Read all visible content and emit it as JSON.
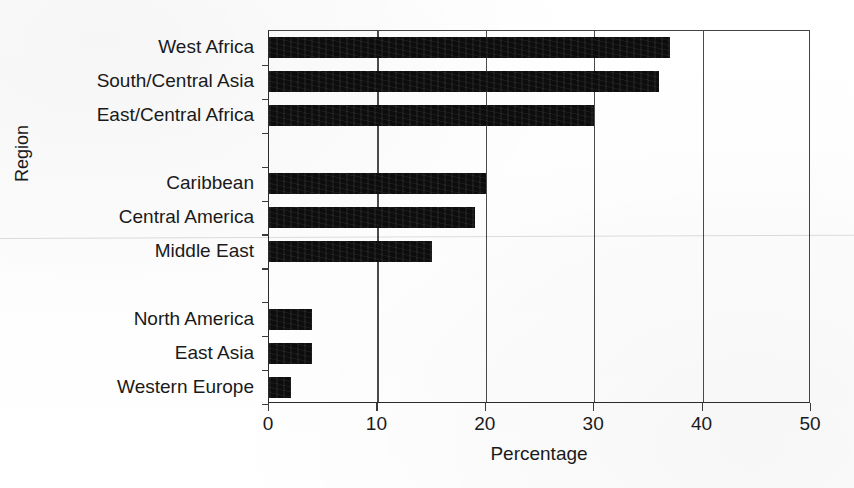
{
  "chart_data": {
    "type": "bar",
    "orientation": "horizontal",
    "title": "",
    "xlabel": "Percentage",
    "ylabel": "Region",
    "xlim": [
      0,
      50
    ],
    "xticks": [
      0,
      10,
      20,
      30,
      40,
      50
    ],
    "grid": "vertical",
    "legend": "none",
    "bar_color": "#0d0d0d",
    "categories": [
      "West Africa",
      "South/Central Asia",
      "East/Central Africa",
      "Caribbean",
      "Central America",
      "Middle East",
      "North America",
      "East Asia",
      "Western Europe"
    ],
    "values": [
      37,
      36,
      30,
      20,
      19,
      15,
      4,
      4,
      2
    ],
    "groups": [
      {
        "name": "high",
        "categories": [
          "West Africa",
          "South/Central Asia",
          "East/Central Africa"
        ]
      },
      {
        "name": "medium",
        "categories": [
          "Caribbean",
          "Central America",
          "Middle East"
        ]
      },
      {
        "name": "low",
        "categories": [
          "North America",
          "East Asia",
          "Western Europe"
        ]
      }
    ],
    "slots": [
      {
        "kind": "bar",
        "category": "West Africa",
        "value": 37
      },
      {
        "kind": "bar",
        "category": "South/Central Asia",
        "value": 36
      },
      {
        "kind": "bar",
        "category": "East/Central Africa",
        "value": 30
      },
      {
        "kind": "gap",
        "category": "",
        "value": null
      },
      {
        "kind": "bar",
        "category": "Caribbean",
        "value": 20
      },
      {
        "kind": "bar",
        "category": "Central America",
        "value": 19
      },
      {
        "kind": "bar",
        "category": "Middle East",
        "value": 15
      },
      {
        "kind": "gap",
        "category": "",
        "value": null
      },
      {
        "kind": "bar",
        "category": "North America",
        "value": 4
      },
      {
        "kind": "bar",
        "category": "East Asia",
        "value": 4
      },
      {
        "kind": "bar",
        "category": "Western Europe",
        "value": 2
      }
    ]
  },
  "axes": {
    "x_title": "Percentage",
    "y_title": "Region",
    "x_tick_labels": [
      "0",
      "10",
      "20",
      "30",
      "40",
      "50"
    ]
  }
}
